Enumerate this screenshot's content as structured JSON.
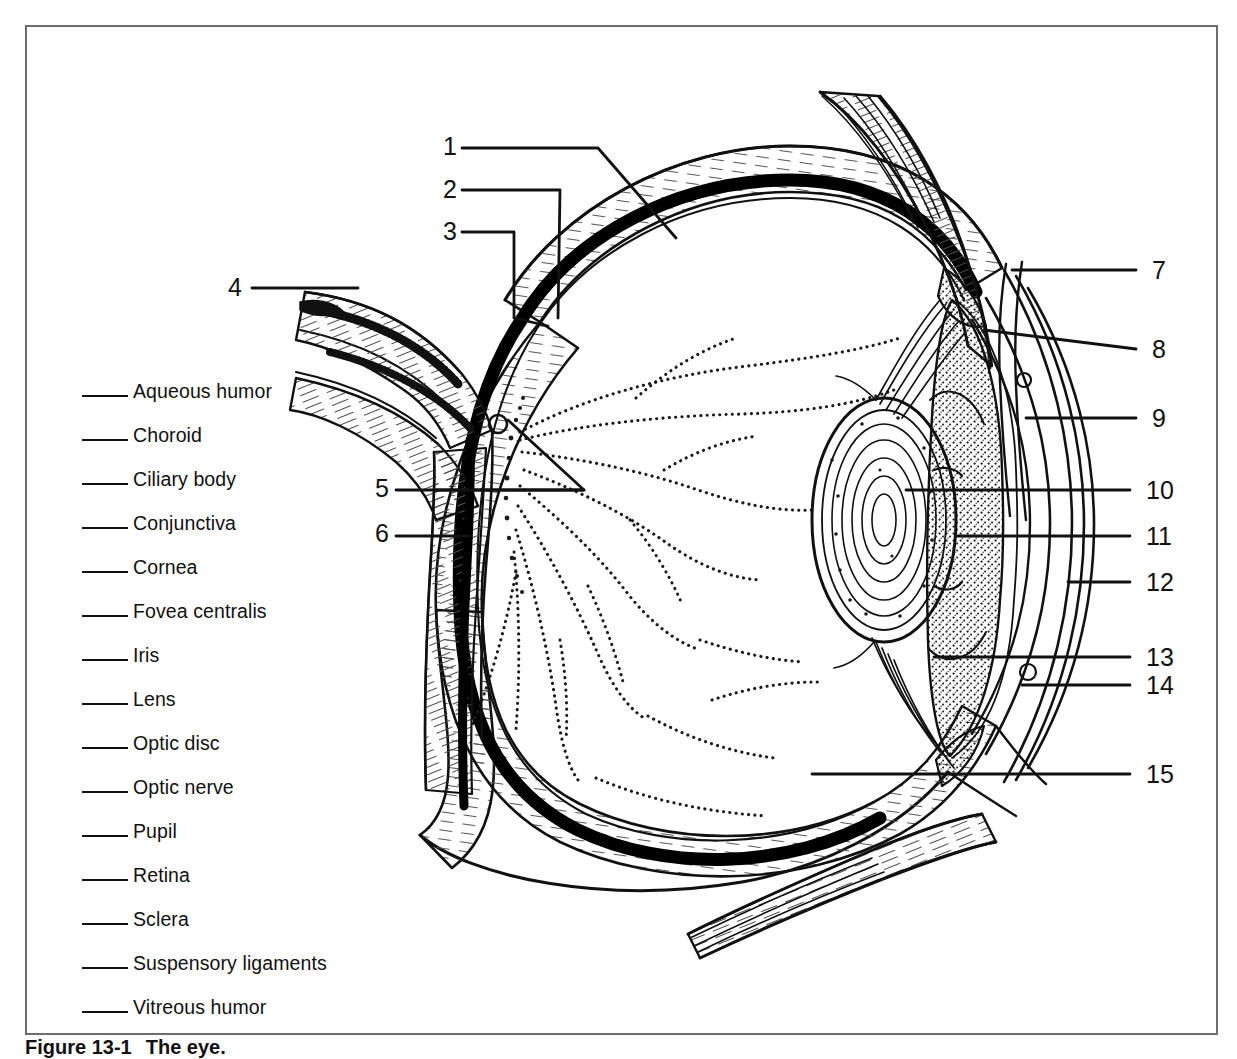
{
  "figure": {
    "caption_number": "Figure 13-1",
    "caption_text": "The eye.",
    "frame_color": "#6d6d6d",
    "ink_color": "#111111",
    "background": "#ffffff"
  },
  "term_list": {
    "instruction_blank": "_____",
    "items": [
      {
        "n": 1,
        "label": "Aqueous humor"
      },
      {
        "n": 2,
        "label": "Choroid"
      },
      {
        "n": 3,
        "label": "Ciliary body"
      },
      {
        "n": 4,
        "label": "Conjunctiva"
      },
      {
        "n": 5,
        "label": "Cornea"
      },
      {
        "n": 6,
        "label": "Fovea centralis"
      },
      {
        "n": 7,
        "label": "Iris"
      },
      {
        "n": 8,
        "label": "Lens"
      },
      {
        "n": 9,
        "label": "Optic disc"
      },
      {
        "n": 10,
        "label": "Optic nerve"
      },
      {
        "n": 11,
        "label": "Pupil"
      },
      {
        "n": 12,
        "label": "Retina"
      },
      {
        "n": 13,
        "label": "Sclera"
      },
      {
        "n": 14,
        "label": "Suspensory ligaments"
      },
      {
        "n": 15,
        "label": "Vitreous humor"
      }
    ]
  },
  "callouts": [
    {
      "id": "1",
      "label": "1",
      "x": 443,
      "y": 134,
      "side": "left"
    },
    {
      "id": "2",
      "label": "2",
      "x": 443,
      "y": 177,
      "side": "left"
    },
    {
      "id": "3",
      "label": "3",
      "x": 443,
      "y": 219,
      "side": "left"
    },
    {
      "id": "4",
      "label": "4",
      "x": 228,
      "y": 275,
      "side": "left"
    },
    {
      "id": "5",
      "label": "5",
      "x": 375,
      "y": 476,
      "side": "left"
    },
    {
      "id": "6",
      "label": "6",
      "x": 375,
      "y": 521,
      "side": "left"
    },
    {
      "id": "7",
      "label": "7",
      "x": 1152,
      "y": 258,
      "side": "right"
    },
    {
      "id": "8",
      "label": "8",
      "x": 1152,
      "y": 337,
      "side": "right"
    },
    {
      "id": "9",
      "label": "9",
      "x": 1152,
      "y": 406,
      "side": "right"
    },
    {
      "id": "10",
      "label": "10",
      "x": 1146,
      "y": 478,
      "side": "right"
    },
    {
      "id": "11",
      "label": "11",
      "x": 1146,
      "y": 524,
      "side": "right"
    },
    {
      "id": "12",
      "label": "12",
      "x": 1146,
      "y": 570,
      "side": "right"
    },
    {
      "id": "13",
      "label": "13",
      "x": 1146,
      "y": 645,
      "side": "right"
    },
    {
      "id": "14",
      "label": "14",
      "x": 1146,
      "y": 673,
      "side": "right"
    },
    {
      "id": "15",
      "label": "15",
      "x": 1146,
      "y": 762,
      "side": "right"
    }
  ]
}
